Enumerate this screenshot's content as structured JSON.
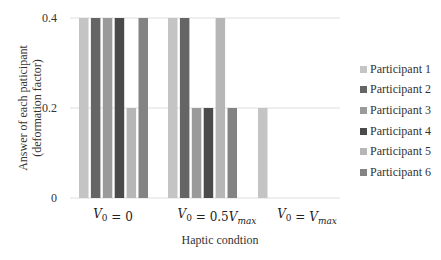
{
  "chart_data": {
    "type": "bar",
    "title": "",
    "xlabel": "Haptic condtion",
    "ylabel_lines": [
      "Answer of each paticipant",
      "(deformation factor)"
    ],
    "ylabel": "Answer of each paticipant (deformation factor)",
    "categories": [
      "V0 = 0",
      "V0 = 0.5Vmax",
      "V0 = Vmax"
    ],
    "category_labels": [
      {
        "main": "V",
        "sub": "0",
        "rest": " = 0",
        "suffix": "",
        "suffix_sub": ""
      },
      {
        "main": "V",
        "sub": "0",
        "rest": " = 0.5",
        "suffix": "V",
        "suffix_sub": "max"
      },
      {
        "main": "V",
        "sub": "0",
        "rest": " = ",
        "suffix": "V",
        "suffix_sub": "max"
      }
    ],
    "yticks": [
      0,
      0.2,
      0.4
    ],
    "ytick_labels": [
      "0",
      "0.2",
      "0.4"
    ],
    "ylim": [
      0,
      0.4
    ],
    "grid": true,
    "legend_position": "right",
    "series": [
      {
        "name": "Participant 1",
        "color": "#c4c4c4",
        "values": [
          0.4,
          0.4,
          0.2
        ]
      },
      {
        "name": "Participant 2",
        "color": "#656565",
        "values": [
          0.4,
          0.4,
          0
        ]
      },
      {
        "name": "Participant 3",
        "color": "#9a9a9a",
        "values": [
          0.4,
          0.2,
          0
        ]
      },
      {
        "name": "Participant 4",
        "color": "#4a4a4a",
        "values": [
          0.4,
          0.2,
          0
        ]
      },
      {
        "name": "Participant 5",
        "color": "#b6b6b6",
        "values": [
          0.2,
          0.4,
          0
        ]
      },
      {
        "name": "Participant 6",
        "color": "#838383",
        "values": [
          0.4,
          0.2,
          0
        ]
      }
    ]
  },
  "axis": {
    "xlabel": "Haptic condtion",
    "ylabel_line1": "Answer of each paticipant",
    "ylabel_line2": "(deformation factor)"
  },
  "legend": {
    "items": [
      {
        "label": "Participant 1",
        "color": "#c4c4c4"
      },
      {
        "label": "Participant 2",
        "color": "#656565"
      },
      {
        "label": "Participant 3",
        "color": "#9a9a9a"
      },
      {
        "label": "Participant 4",
        "color": "#4a4a4a"
      },
      {
        "label": "Participant 5",
        "color": "#b6b6b6"
      },
      {
        "label": "Participant 6",
        "color": "#838383"
      }
    ]
  },
  "colors": {
    "gridline": "#dedede",
    "axis_text": "#333333"
  }
}
